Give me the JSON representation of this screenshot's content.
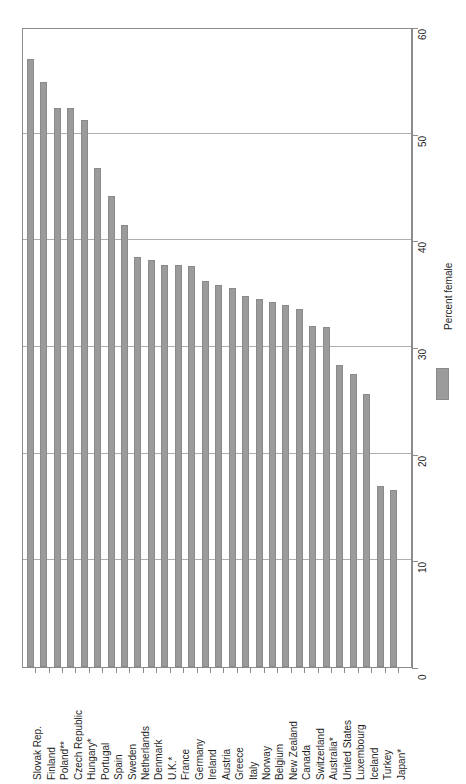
{
  "chart_data": {
    "type": "bar",
    "title": "",
    "xlabel": "",
    "ylabel": "Percent female",
    "ylim": [
      0,
      60
    ],
    "yticks": [
      0,
      10,
      20,
      30,
      40,
      50,
      60
    ],
    "ytick_labels": [
      "0",
      "10",
      "20",
      "30",
      "40",
      "50",
      "60"
    ],
    "grid": true,
    "grid_axis": "y",
    "legend_position": "right",
    "legend": [
      "Percent female"
    ],
    "orientation": "vertical",
    "bar_color": "#9b9b9b",
    "categories": [
      "Slovak Rep.",
      "Finland",
      "Poland**",
      "Czech Republic",
      "Hungary*",
      "Portugal",
      "Spain",
      "Sweden",
      "Netherlands",
      "Denmark",
      "U.K.*",
      "France",
      "Germany",
      "Ireland",
      "Austria",
      "Greece",
      "Italy",
      "Norway",
      "Belgium",
      "New Zealand",
      "Canada",
      "Switzerland",
      "Australia*",
      "United States",
      "Luxembourg",
      "Iceland",
      "Turkey",
      "Japan*"
    ],
    "values": [
      57.0,
      54.8,
      52.4,
      52.4,
      51.3,
      46.8,
      44.2,
      41.4,
      38.4,
      38.2,
      37.7,
      37.7,
      37.6,
      36.2,
      35.8,
      35.5,
      34.8,
      34.5,
      34.2,
      33.9,
      33.6,
      32.0,
      31.9,
      28.3,
      27.5,
      25.6,
      17.0,
      16.6
    ],
    "series": [
      {
        "name": "Percent female",
        "values": [
          57.0,
          54.8,
          52.4,
          52.4,
          51.3,
          46.8,
          44.2,
          41.4,
          38.4,
          38.2,
          37.7,
          37.7,
          37.6,
          36.2,
          35.8,
          35.5,
          34.8,
          34.5,
          34.2,
          33.9,
          33.6,
          32.0,
          31.9,
          28.3,
          27.5,
          25.6,
          17.0,
          16.6
        ]
      }
    ]
  },
  "axis": {
    "y_axis_side": "right",
    "y_title": "Percent female"
  },
  "legend": {
    "label": "Percent female"
  }
}
